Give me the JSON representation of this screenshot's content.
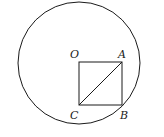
{
  "diagram": {
    "type": "geometry",
    "circle": {
      "center": "O",
      "cx": 79,
      "cy": 62,
      "r": 61
    },
    "square": {
      "vertices": [
        "O",
        "A",
        "B",
        "C"
      ]
    },
    "segments": [
      "OA",
      "AB",
      "BC",
      "CO",
      "AC"
    ],
    "points": [
      {
        "name": "O",
        "x": 79,
        "y": 62,
        "label": "O",
        "lx": 71,
        "ly": 58
      },
      {
        "name": "A",
        "x": 122,
        "y": 62,
        "label": "A",
        "lx": 118,
        "ly": 58
      },
      {
        "name": "B",
        "x": 122,
        "y": 105,
        "label": "B",
        "lx": 120,
        "ly": 119
      },
      {
        "name": "C",
        "x": 79,
        "y": 105,
        "label": "C",
        "lx": 70,
        "ly": 119
      }
    ],
    "stroke_color": "#1a1a1a"
  }
}
